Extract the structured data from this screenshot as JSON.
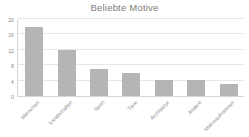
{
  "chart_data": {
    "type": "bar",
    "title": "Beliebte Motive",
    "xlabel": "",
    "ylabel": "",
    "categories": [
      "Menschen",
      "Landschaften",
      "Sport",
      "Tiere",
      "Architektur",
      "Andere",
      "Makroaufnahmen"
    ],
    "values": [
      18,
      12,
      7,
      6,
      4.2,
      4.2,
      3
    ],
    "ylim": [
      0,
      20
    ],
    "yticks": [
      0,
      4,
      8,
      12,
      16,
      20
    ],
    "ytick_labels": [
      "0",
      "4",
      "8",
      "12",
      "16",
      "20"
    ],
    "grid": true,
    "legend": false,
    "bar_color": "#b5b5b5",
    "grid_color": "#e6e6e6",
    "axis_color": "#d6d6d6",
    "text_color": "#8a8a8a",
    "title_color": "#7b7b7b",
    "background": "#ffffff"
  }
}
